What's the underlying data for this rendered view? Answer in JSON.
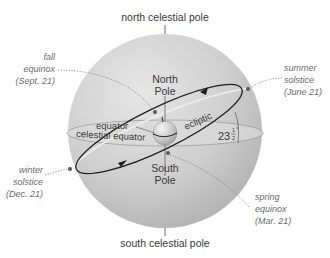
{
  "colors": {
    "sphere_light": "#e4e4e4",
    "sphere_dark": "#b4b4b4",
    "equator_band": "#d6d6d6",
    "ecliptic_line": "#2a2a2a",
    "text": "#3a3a3a",
    "event_text": "#6b6b6b",
    "dotted_leader": "#7a7a7a"
  },
  "labels": {
    "north_celestial_pole": "north celestial pole",
    "south_celestial_pole": "south celestial pole",
    "north_pole_line1": "North",
    "north_pole_line2": "Pole",
    "south_pole_line1": "South",
    "south_pole_line2": "Pole",
    "equator": "equator",
    "celestial_equator": "celestial equator",
    "ecliptic": "ecliptic",
    "tilt_whole": "23",
    "tilt_fraction_num": "1",
    "tilt_fraction_den": "2",
    "tilt_degree": "°"
  },
  "events": {
    "fall_equinox": {
      "line1": "fall",
      "line2": "equinox",
      "line3": "(Sept. 21)"
    },
    "summer_solstice": {
      "line1": "summer",
      "line2": "solstice",
      "line3": "(June 21)"
    },
    "winter_solstice": {
      "line1": "winter",
      "line2": "solstice",
      "line3": "(Dec. 21)"
    },
    "spring_equinox": {
      "line1": "spring",
      "line2": "equinox",
      "line3": "(Mar. 21)"
    }
  }
}
